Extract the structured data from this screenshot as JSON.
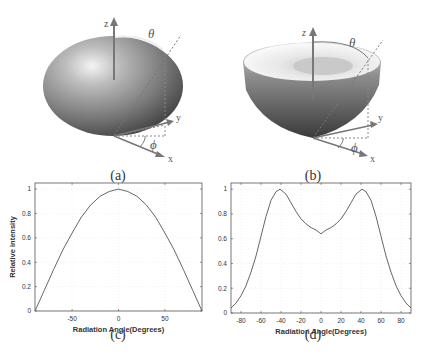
{
  "figure": {
    "panels": [
      {
        "id": "a",
        "caption": "(a)",
        "type": "3d-radiation-pattern",
        "shape": "ellipsoid",
        "axes": {
          "z": "z",
          "y": "y",
          "x": "x"
        },
        "angles": {
          "theta": "θ",
          "phi": "ϕ"
        }
      },
      {
        "id": "b",
        "caption": "(b)",
        "type": "3d-radiation-pattern",
        "shape": "bowl",
        "axes": {
          "z": "z",
          "y": "y",
          "x": "x"
        },
        "angles": {
          "theta": "θ",
          "phi": "ϕ"
        }
      },
      {
        "id": "c",
        "caption": "(c)",
        "xlabel": "Radiation Angle(Degrees)",
        "ylabel": "Relative intensity",
        "xticks": [
          "-50",
          "0",
          "50"
        ],
        "yticks": [
          "0",
          "0.2",
          "0.4",
          "0.6",
          "0.8",
          "1"
        ]
      },
      {
        "id": "d",
        "caption": "(d)",
        "xlabel": "Radiation Angle(Degrees)",
        "ylabel": "Relative intensity",
        "xticks": [
          "-80",
          "-60",
          "-40",
          "-20",
          "0",
          "20",
          "40",
          "60",
          "80"
        ],
        "yticks": [
          "0",
          "0.2",
          "0.4",
          "0.6",
          "0.8",
          "1"
        ]
      }
    ]
  },
  "chart_data": [
    {
      "type": "line",
      "panel": "c",
      "title": "",
      "xlabel": "Radiation Angle(Degrees)",
      "ylabel": "Relative intensity",
      "xlim": [
        -90,
        90
      ],
      "ylim": [
        0,
        1.05
      ],
      "grid": true,
      "xticks": [
        -50,
        0,
        50
      ],
      "yticks": [
        0,
        0.2,
        0.4,
        0.6,
        0.8,
        1
      ],
      "series": [
        {
          "name": "Relative intensity",
          "x": [
            -90,
            -80,
            -70,
            -60,
            -50,
            -40,
            -30,
            -20,
            -10,
            0,
            10,
            20,
            30,
            40,
            50,
            60,
            70,
            80,
            90
          ],
          "values": [
            0.0,
            0.17,
            0.34,
            0.5,
            0.64,
            0.77,
            0.87,
            0.94,
            0.98,
            1.0,
            0.98,
            0.94,
            0.87,
            0.77,
            0.64,
            0.5,
            0.34,
            0.17,
            0.0
          ]
        }
      ]
    },
    {
      "type": "line",
      "panel": "d",
      "title": "",
      "xlabel": "Radiation Angle(Degrees)",
      "ylabel": "Relative intensity",
      "xlim": [
        -90,
        90
      ],
      "ylim": [
        0,
        1.05
      ],
      "grid": true,
      "xticks": [
        -80,
        -60,
        -40,
        -20,
        0,
        20,
        40,
        60,
        80
      ],
      "yticks": [
        0,
        0.2,
        0.4,
        0.6,
        0.8,
        1
      ],
      "series": [
        {
          "name": "Relative intensity",
          "x": [
            -90,
            -85,
            -80,
            -75,
            -70,
            -65,
            -60,
            -55,
            -50,
            -45,
            -41,
            -35,
            -30,
            -25,
            -20,
            -15,
            -10,
            -5,
            0,
            5,
            10,
            15,
            20,
            25,
            30,
            35,
            41,
            45,
            50,
            55,
            60,
            65,
            70,
            75,
            80,
            85,
            90
          ],
          "values": [
            0.04,
            0.08,
            0.14,
            0.22,
            0.33,
            0.46,
            0.62,
            0.78,
            0.91,
            0.98,
            1.0,
            0.96,
            0.89,
            0.82,
            0.76,
            0.72,
            0.69,
            0.67,
            0.64,
            0.67,
            0.69,
            0.72,
            0.76,
            0.82,
            0.89,
            0.96,
            1.0,
            0.98,
            0.91,
            0.78,
            0.62,
            0.46,
            0.33,
            0.22,
            0.14,
            0.08,
            0.04
          ]
        }
      ]
    }
  ]
}
